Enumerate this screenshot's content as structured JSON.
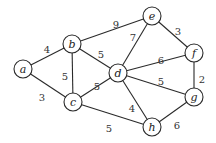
{
  "graph": {
    "type": "undirected-weighted",
    "nodes": [
      {
        "id": "a",
        "label": "a",
        "x": 23,
        "y": 69
      },
      {
        "id": "b",
        "label": "b",
        "x": 72,
        "y": 44
      },
      {
        "id": "c",
        "label": "c",
        "x": 73,
        "y": 102
      },
      {
        "id": "d",
        "label": "d",
        "x": 118,
        "y": 73
      },
      {
        "id": "e",
        "label": "e",
        "x": 152,
        "y": 16
      },
      {
        "id": "f",
        "label": "f",
        "x": 194,
        "y": 53
      },
      {
        "id": "g",
        "label": "g",
        "x": 194,
        "y": 97
      },
      {
        "id": "h",
        "label": "h",
        "x": 152,
        "y": 127
      }
    ],
    "edges": [
      {
        "from": "a",
        "to": "b",
        "weight": "4",
        "lx": 47,
        "ly": 49
      },
      {
        "from": "a",
        "to": "c",
        "weight": "3",
        "lx": 42,
        "ly": 97
      },
      {
        "from": "b",
        "to": "c",
        "weight": "5",
        "lx": 65,
        "ly": 76
      },
      {
        "from": "b",
        "to": "d",
        "weight": "5",
        "lx": 101,
        "ly": 54
      },
      {
        "from": "b",
        "to": "e",
        "weight": "9",
        "lx": 116,
        "ly": 24
      },
      {
        "from": "c",
        "to": "d",
        "weight": "5",
        "lx": 97,
        "ly": 86
      },
      {
        "from": "c",
        "to": "h",
        "weight": "5",
        "lx": 109,
        "ly": 128
      },
      {
        "from": "d",
        "to": "e",
        "weight": "7",
        "lx": 133,
        "ly": 37
      },
      {
        "from": "d",
        "to": "f",
        "weight": "6",
        "lx": 161,
        "ly": 60
      },
      {
        "from": "d",
        "to": "g",
        "weight": "5",
        "lx": 161,
        "ly": 81
      },
      {
        "from": "d",
        "to": "h",
        "weight": "4",
        "lx": 132,
        "ly": 108
      },
      {
        "from": "e",
        "to": "f",
        "weight": "3",
        "lx": 178,
        "ly": 31
      },
      {
        "from": "f",
        "to": "g",
        "weight": "2",
        "lx": 202,
        "ly": 79
      },
      {
        "from": "g",
        "to": "h",
        "weight": "6",
        "lx": 177,
        "ly": 125
      }
    ]
  }
}
